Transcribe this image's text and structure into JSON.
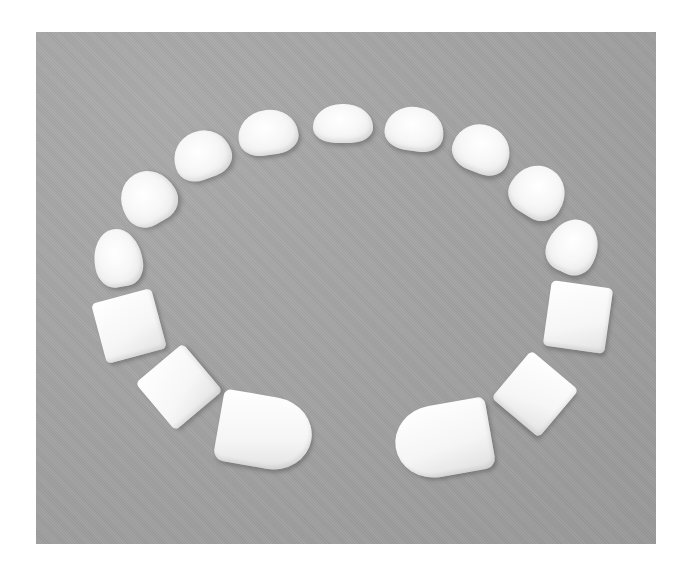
{
  "image": {
    "description": "Photograph of white foam pieces arranged in a U-shaped dental arch on a gray background",
    "background_color": "#a4a4a4",
    "piece_color": "#f7f7f7",
    "frame_color": "#ffffff"
  },
  "pieces": [
    {
      "id": "molar-left-1",
      "shape": "rounded",
      "x": 58,
      "y": 197,
      "w": 48,
      "h": 58,
      "rot": -10
    },
    {
      "id": "molar-left-2",
      "shape": "rounded",
      "x": 84,
      "y": 139,
      "w": 56,
      "h": 54,
      "rot": -30
    },
    {
      "id": "molar-left-3",
      "shape": "rounded",
      "x": 137,
      "y": 99,
      "w": 58,
      "h": 48,
      "rot": -20
    },
    {
      "id": "molar-left-4",
      "shape": "rounded",
      "x": 202,
      "y": 78,
      "w": 60,
      "h": 45,
      "rot": -8
    },
    {
      "id": "molar-center-left",
      "shape": "rounded",
      "x": 277,
      "y": 72,
      "w": 60,
      "h": 39,
      "rot": 0
    },
    {
      "id": "molar-center-right",
      "shape": "rounded",
      "x": 349,
      "y": 75,
      "w": 59,
      "h": 44,
      "rot": 8
    },
    {
      "id": "molar-right-3",
      "shape": "rounded",
      "x": 417,
      "y": 93,
      "w": 58,
      "h": 48,
      "rot": 22
    },
    {
      "id": "molar-right-2",
      "shape": "rounded",
      "x": 474,
      "y": 134,
      "w": 56,
      "h": 52,
      "rot": 32
    },
    {
      "id": "molar-right-1",
      "shape": "rounded",
      "x": 512,
      "y": 187,
      "w": 50,
      "h": 55,
      "rot": 25
    },
    {
      "id": "square-left-upper",
      "shape": "square",
      "x": 62,
      "y": 263,
      "w": 62,
      "h": 62,
      "rot": -15
    },
    {
      "id": "square-left-lower",
      "shape": "square",
      "x": 112,
      "y": 324,
      "w": 62,
      "h": 62,
      "rot": -40
    },
    {
      "id": "square-right-upper",
      "shape": "square",
      "x": 511,
      "y": 252,
      "w": 62,
      "h": 66,
      "rot": 8
    },
    {
      "id": "square-right-lower",
      "shape": "square",
      "x": 468,
      "y": 331,
      "w": 62,
      "h": 62,
      "rot": 40
    },
    {
      "id": "incisor-left",
      "shape": "incisor",
      "x": 182,
      "y": 364,
      "w": 94,
      "h": 72,
      "rot": 10
    },
    {
      "id": "incisor-right",
      "shape": "incisor",
      "x": 359,
      "y": 372,
      "w": 96,
      "h": 72,
      "rot": -10
    }
  ]
}
